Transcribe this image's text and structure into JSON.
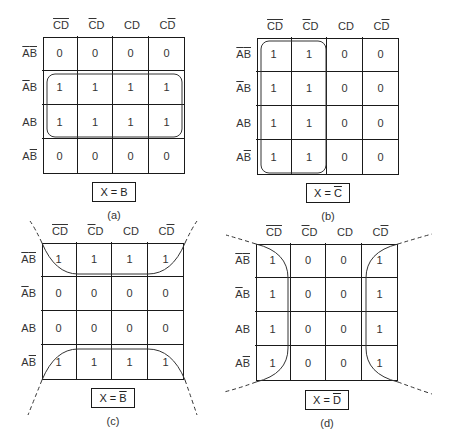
{
  "column_headers": [
    {
      "c": "C",
      "c_bar": true,
      "d": "D",
      "d_bar": true
    },
    {
      "c": "C",
      "c_bar": true,
      "d": "D",
      "d_bar": false
    },
    {
      "c": "C",
      "c_bar": false,
      "d": "D",
      "d_bar": false
    },
    {
      "c": "C",
      "c_bar": false,
      "d": "D",
      "d_bar": true
    }
  ],
  "row_headers": [
    {
      "a": "A",
      "a_bar": true,
      "b": "B",
      "b_bar": true
    },
    {
      "a": "A",
      "a_bar": true,
      "b": "B",
      "b_bar": false
    },
    {
      "a": "A",
      "a_bar": false,
      "b": "B",
      "b_bar": false
    },
    {
      "a": "A",
      "a_bar": false,
      "b": "B",
      "b_bar": true
    }
  ],
  "maps": [
    {
      "id": "a",
      "caption": "(a)",
      "formula_lhs": "X = ",
      "formula_var": "B",
      "formula_bar": false,
      "cells": [
        [
          "0",
          "0",
          "0",
          "0"
        ],
        [
          "1",
          "1",
          "1",
          "1"
        ],
        [
          "1",
          "1",
          "1",
          "1"
        ],
        [
          "0",
          "0",
          "0",
          "0"
        ]
      ],
      "grouping": "rows AB-bar-A and AB (middle two rows)"
    },
    {
      "id": "b",
      "caption": "(b)",
      "formula_lhs": "X = ",
      "formula_var": "C",
      "formula_bar": true,
      "cells": [
        [
          "1",
          "1",
          "0",
          "0"
        ],
        [
          "1",
          "1",
          "0",
          "0"
        ],
        [
          "1",
          "1",
          "0",
          "0"
        ],
        [
          "1",
          "1",
          "0",
          "0"
        ]
      ],
      "grouping": "first two columns"
    },
    {
      "id": "c",
      "caption": "(c)",
      "formula_lhs": "X = ",
      "formula_var": "B",
      "formula_bar": true,
      "cells": [
        [
          "1",
          "1",
          "1",
          "1"
        ],
        [
          "0",
          "0",
          "0",
          "0"
        ],
        [
          "0",
          "0",
          "0",
          "0"
        ],
        [
          "1",
          "1",
          "1",
          "1"
        ]
      ],
      "grouping": "top and bottom rows (wrap-around)"
    },
    {
      "id": "d",
      "caption": "(d)",
      "formula_lhs": "X = ",
      "formula_var": "D",
      "formula_bar": true,
      "cells": [
        [
          "1",
          "0",
          "0",
          "1"
        ],
        [
          "1",
          "0",
          "0",
          "1"
        ],
        [
          "1",
          "0",
          "0",
          "1"
        ],
        [
          "1",
          "0",
          "0",
          "1"
        ]
      ],
      "grouping": "first and last columns (wrap-around)"
    }
  ]
}
